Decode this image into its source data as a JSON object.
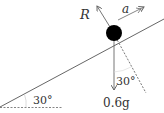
{
  "diagram": {
    "labels": {
      "reaction": "R",
      "acceleration": "a",
      "weight": "0.6g",
      "angle_incline": "30°",
      "angle_weight": "30°"
    },
    "colors": {
      "line": "#555555",
      "ball": "#000000",
      "text": "#333333"
    }
  }
}
